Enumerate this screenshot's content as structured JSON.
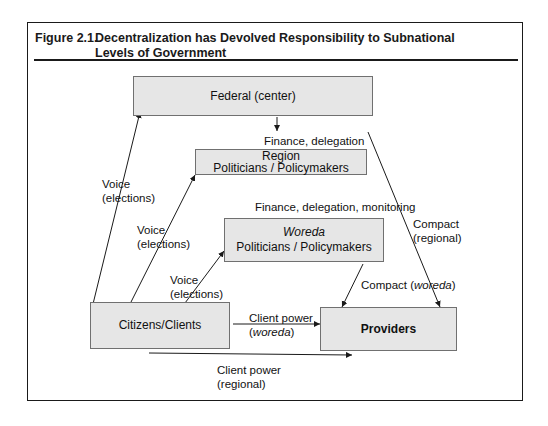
{
  "figure": {
    "number": "Figure 2.1.",
    "title": "Decentralization has Devolved Responsibility to Subnational Levels of Government"
  },
  "nodes": {
    "federal": {
      "label": "Federal (center)"
    },
    "region": {
      "line1": "Region",
      "line2": "Politicians / Policymakers"
    },
    "woreda": {
      "line1": "Woreda",
      "line2": "Politicians / Policymakers"
    },
    "citizens": {
      "label": "Citizens/Clients"
    },
    "providers": {
      "label": "Providers"
    }
  },
  "edges": {
    "federal_to_region": "Finance, delegation",
    "region_to_woreda": "Finance, delegation, monitoring",
    "voice_federal": {
      "line1": "Voice",
      "line2": "(elections)"
    },
    "voice_region": {
      "line1": "Voice",
      "line2": "(elections)"
    },
    "voice_woreda": {
      "line1": "Voice",
      "line2": "(elections)"
    },
    "compact_regional": {
      "line1": "Compact",
      "line2": "(regional)"
    },
    "compact_woreda": {
      "prefix": "Compact (",
      "italic": "woreda",
      "suffix": ")"
    },
    "client_power_woreda": {
      "line1": "Client power",
      "prefix": "(",
      "italic": "woreda",
      "suffix": ")"
    },
    "client_power_regional": {
      "line1": "Client power",
      "line2": "(regional)"
    }
  },
  "colors": {
    "box_fill": "#e6e6e6",
    "box_border": "#707070",
    "line": "#1a1a1a"
  }
}
